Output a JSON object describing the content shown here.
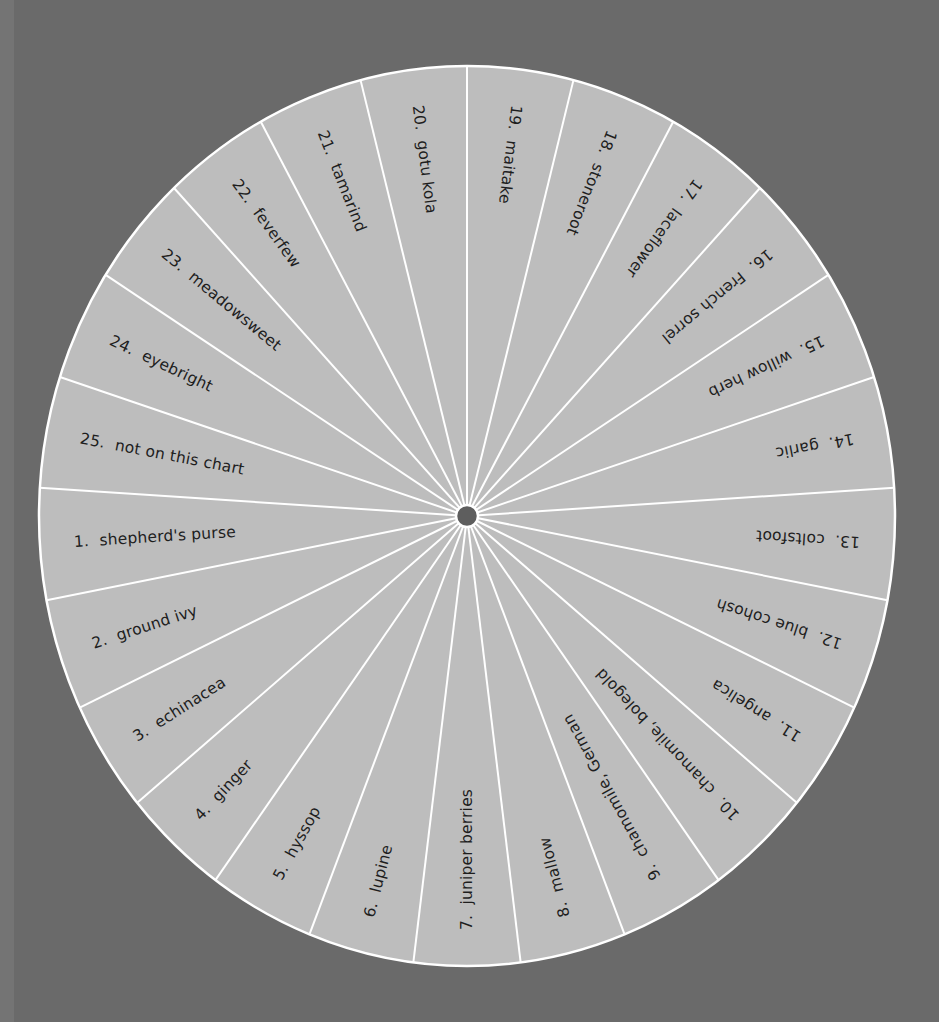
{
  "diagram": {
    "type": "radial-wheel",
    "background_color": "#6a6a6a",
    "wheel_fill": "#bdbdbd",
    "divider_color": "#ffffff",
    "hub_color": "#5e5e5e",
    "center": [
      467,
      516
    ],
    "radius_x": 428,
    "radius_y": 450,
    "segment_count": 25
  },
  "segments": [
    {
      "number": "1.",
      "label": "shepherd's purse"
    },
    {
      "number": "2.",
      "label": "ground ivy"
    },
    {
      "number": "3.",
      "label": "echinacea"
    },
    {
      "number": "4.",
      "label": "ginger"
    },
    {
      "number": "5.",
      "label": "hyssop"
    },
    {
      "number": "6.",
      "label": "lupine"
    },
    {
      "number": "7.",
      "label": "juniper berries"
    },
    {
      "number": "8.",
      "label": "mallow"
    },
    {
      "number": "9.",
      "label": "chamomile, German"
    },
    {
      "number": "10.",
      "label": "chamomile, bolegold"
    },
    {
      "number": "11.",
      "label": "angelica"
    },
    {
      "number": "12.",
      "label": "blue cohosh"
    },
    {
      "number": "13.",
      "label": "coltsfoot"
    },
    {
      "number": "14.",
      "label": "garlic"
    },
    {
      "number": "15.",
      "label": "willow herb"
    },
    {
      "number": "16.",
      "label": "French sorrel"
    },
    {
      "number": "17.",
      "label": "laceflower"
    },
    {
      "number": "18.",
      "label": "stoneroot"
    },
    {
      "number": "19.",
      "label": "maitake"
    },
    {
      "number": "20.",
      "label": "gotu kola"
    },
    {
      "number": "21.",
      "label": "tamarind"
    },
    {
      "number": "22.",
      "label": "feverfew"
    },
    {
      "number": "23.",
      "label": "meadowsweet"
    },
    {
      "number": "24.",
      "label": "eyebright"
    },
    {
      "number": "25.",
      "label": "not on this chart"
    }
  ]
}
